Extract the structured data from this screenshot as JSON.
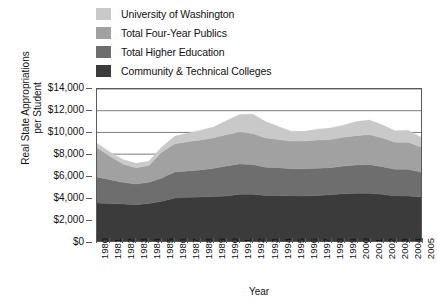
{
  "legend": {
    "items": [
      {
        "label": "University of Washington",
        "color": "#c9c9c9",
        "swatch_name": "legend-swatch-university-of-washington"
      },
      {
        "label": "Total Four-Year Publics",
        "color": "#a1a1a1",
        "swatch_name": "legend-swatch-total-four-year-publics"
      },
      {
        "label": "Total Higher Education",
        "color": "#6e6e6e",
        "swatch_name": "legend-swatch-total-higher-education"
      },
      {
        "label": "Community & Technical Colleges",
        "color": "#3b3b3b",
        "swatch_name": "legend-swatch-community-technical-colleges"
      }
    ]
  },
  "axes": {
    "y_title_line1": "Real State Appropriations",
    "y_title_line2": "per Student",
    "x_title": "Year",
    "y_ticks": [
      "$14,000",
      "$12,000",
      "$10,000",
      "$8,000",
      "$6,000",
      "$4,000",
      "$2,000",
      "$0"
    ]
  },
  "chart_data": {
    "type": "area",
    "stacked": true,
    "title": "",
    "xlabel": "Year",
    "ylabel": "Real State Appropriations per Student",
    "ylim": [
      0,
      14000
    ],
    "ytick_values": [
      0,
      2000,
      4000,
      6000,
      8000,
      10000,
      12000,
      14000
    ],
    "ytick_labels": [
      "$0",
      "$2,000",
      "$4,000",
      "$6,000",
      "$8,000",
      "$10,000",
      "$12,000",
      "$14,000"
    ],
    "grid": true,
    "grid_axis": "y",
    "legend_position": "above-plot-left",
    "categories": [
      "1980",
      "1981",
      "1982",
      "1983",
      "1984",
      "1985",
      "1986",
      "1987",
      "1988",
      "1989",
      "1990",
      "1991",
      "1992",
      "1993",
      "1994",
      "1995",
      "1996",
      "1997",
      "1998",
      "1999",
      "2000",
      "2001",
      "2002",
      "2003",
      "2004",
      "2005"
    ],
    "series": [
      {
        "name": "Community & Technical Colleges",
        "color": "#3b3b3b",
        "stack_order": 1,
        "values": [
          3500,
          3450,
          3400,
          3350,
          3450,
          3650,
          3950,
          4000,
          4050,
          4100,
          4150,
          4300,
          4300,
          4200,
          4200,
          4150,
          4150,
          4200,
          4250,
          4350,
          4400,
          4400,
          4300,
          4150,
          4150,
          4050
        ]
      },
      {
        "name": "Total Higher Education",
        "color": "#6e6e6e",
        "stack_order": 2,
        "values": [
          2400,
          2200,
          2000,
          1900,
          1950,
          2150,
          2400,
          2450,
          2500,
          2600,
          2750,
          2800,
          2750,
          2600,
          2550,
          2500,
          2500,
          2500,
          2500,
          2550,
          2600,
          2650,
          2550,
          2450,
          2450,
          2300
        ]
      },
      {
        "name": "Total Four-Year Publics",
        "color": "#a1a1a1",
        "stack_order": 3,
        "values": [
          2700,
          2150,
          1700,
          1500,
          1550,
          2400,
          2600,
          2700,
          2750,
          2800,
          2900,
          2950,
          2850,
          2700,
          2600,
          2550,
          2550,
          2600,
          2600,
          2650,
          2700,
          2750,
          2650,
          2500,
          2500,
          2300
        ]
      },
      {
        "name": "University of Washington",
        "color": "#c9c9c9",
        "stack_order": 4,
        "values": [
          400,
          400,
          400,
          400,
          400,
          450,
          700,
          800,
          900,
          1000,
          1300,
          1600,
          1800,
          1500,
          1200,
          900,
          900,
          1000,
          1050,
          1100,
          1300,
          1350,
          1200,
          1050,
          1100,
          900
        ]
      }
    ],
    "stack_totals": [
      9000,
      8200,
      7500,
      7150,
      7350,
      8650,
      9650,
      9950,
      10200,
      10500,
      11100,
      11650,
      11700,
      11000,
      10550,
      10100,
      10100,
      10300,
      10400,
      10650,
      11000,
      11150,
      10700,
      10150,
      10200,
      9550
    ]
  }
}
